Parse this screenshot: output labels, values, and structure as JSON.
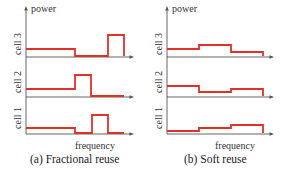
{
  "figure": {
    "panels": [
      {
        "id": "a",
        "caption": "(a)  Fractional reuse",
        "y_axis_label": "power",
        "x_axis_label": "frequency",
        "cells": [
          {
            "label": "cell 3",
            "steps": [
              [
                0,
                "low"
              ],
              [
                1,
                "zero"
              ],
              [
                2,
                "zero"
              ],
              [
                3,
                "high"
              ]
            ]
          },
          {
            "label": "cell 2",
            "steps": [
              [
                0,
                "low"
              ],
              [
                1,
                "low"
              ],
              [
                2,
                "high"
              ],
              [
                3,
                "zero"
              ]
            ]
          },
          {
            "label": "cell 1",
            "steps": [
              [
                0,
                "low"
              ],
              [
                1,
                "zero"
              ],
              [
                2,
                "high"
              ],
              [
                3,
                "zero"
              ]
            ]
          }
        ]
      },
      {
        "id": "b",
        "caption": "(b)  Soft reuse",
        "y_axis_label": "power",
        "x_axis_label": "frequency",
        "cells": [
          {
            "label": "cell 3",
            "levels": [
              "mid",
              "high",
              "low"
            ]
          },
          {
            "label": "cell 2",
            "levels": [
              "high",
              "low",
              "mid"
            ]
          },
          {
            "label": "cell 1",
            "levels": [
              "low",
              "mid",
              "high"
            ]
          }
        ]
      }
    ],
    "colors": {
      "power_line": "#e0302a",
      "axis": "#555555"
    }
  },
  "labels": {
    "a_power": "power",
    "a_freq": "frequency",
    "a_cell3": "cell 3",
    "a_cell2": "cell 2",
    "a_cell1": "cell 1",
    "a_caption": "(a)  Fractional reuse",
    "b_power": "power",
    "b_freq": "frequency",
    "b_cell3": "cell 3",
    "b_cell2": "cell 2",
    "b_cell1": "cell 1",
    "b_caption": "(b)  Soft reuse"
  }
}
